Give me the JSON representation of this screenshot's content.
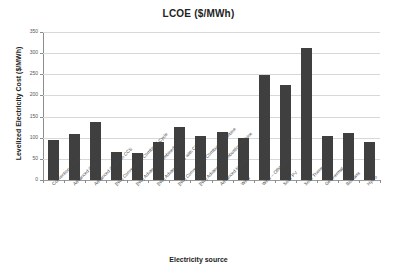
{
  "chart_data": {
    "type": "bar",
    "title": "LCOE ($/MWh)",
    "xlabel": "Electricity source",
    "ylabel": "Levelized Electricity Cost ($/MWh)",
    "ylim": [
      0,
      350
    ],
    "yticks": [
      0,
      50,
      100,
      150,
      200,
      250,
      300,
      350
    ],
    "grid": true,
    "legend": false,
    "bar_color": "#3f3f3f",
    "categories": [
      "Conventional Coal",
      "Advanced Coal",
      "Advanced Coal with CCS",
      "[NG] Conventional Combined Cycle",
      "[NG] Advanced Combined Cycle",
      "[NG] Advanced CC with CCS",
      "[NG] Conventional Combustion Turbine",
      "[NG] Advanced Combustion Turbine",
      "Advanced Nuclear",
      "Wind",
      "Wind -- Offshore",
      "Solar PV",
      "Solar Thermal",
      "Geothermal",
      "Biomass",
      "Hydro"
    ],
    "values": [
      95,
      109,
      136,
      66,
      63,
      90,
      125,
      104,
      113,
      99,
      248,
      225,
      312,
      103,
      112,
      90
    ]
  },
  "axis": {
    "ytick_labels": [
      "350",
      "300",
      "250",
      "200",
      "150",
      "100",
      "50",
      "0"
    ]
  }
}
